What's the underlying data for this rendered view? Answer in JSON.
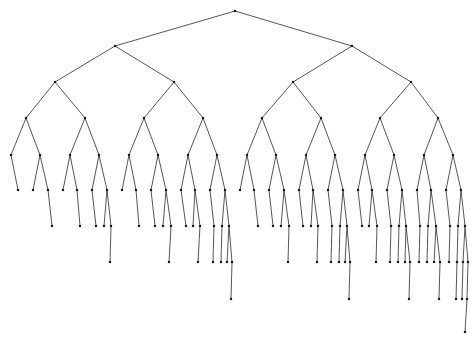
{
  "figure": {
    "type": "node-link-tree",
    "background_color": "#ffffff",
    "edge_color": "#2b2b2b",
    "node_color": "#1a1a1a",
    "edge_width": 0.8,
    "node_size": 2.2,
    "width": 475,
    "height": 345
  },
  "chart_data": {
    "type": "diagram",
    "subtype": "binary-tree",
    "orientation": "top-down",
    "root": {
      "x": 235,
      "y": 11
    },
    "level_y": [
      11,
      46,
      82,
      118,
      155,
      190,
      226,
      262,
      299,
      332
    ],
    "level_counts": [
      1,
      2,
      4,
      8,
      16,
      32,
      37,
      22,
      7,
      1
    ],
    "max_depth": 9,
    "nodes": [
      {
        "id": 0,
        "level": 0,
        "x": 235,
        "y": 11,
        "parent": null
      },
      {
        "id": 1,
        "level": 1,
        "x": 115,
        "y": 46,
        "parent": 0
      },
      {
        "id": 2,
        "level": 1,
        "x": 352,
        "y": 46,
        "parent": 0
      },
      {
        "id": 3,
        "level": 2,
        "x": 55,
        "y": 82,
        "parent": 1
      },
      {
        "id": 4,
        "level": 2,
        "x": 174,
        "y": 82,
        "parent": 1
      },
      {
        "id": 5,
        "level": 2,
        "x": 293,
        "y": 82,
        "parent": 2
      },
      {
        "id": 6,
        "level": 2,
        "x": 411,
        "y": 82,
        "parent": 2
      },
      {
        "id": 7,
        "level": 3,
        "x": 26,
        "y": 118,
        "parent": 3
      },
      {
        "id": 8,
        "level": 3,
        "x": 85,
        "y": 118,
        "parent": 3
      },
      {
        "id": 9,
        "level": 3,
        "x": 144,
        "y": 118,
        "parent": 4
      },
      {
        "id": 10,
        "level": 3,
        "x": 203,
        "y": 118,
        "parent": 4
      },
      {
        "id": 11,
        "level": 3,
        "x": 262,
        "y": 118,
        "parent": 5
      },
      {
        "id": 12,
        "level": 3,
        "x": 321,
        "y": 118,
        "parent": 5
      },
      {
        "id": 13,
        "level": 3,
        "x": 380,
        "y": 118,
        "parent": 6
      },
      {
        "id": 14,
        "level": 3,
        "x": 438,
        "y": 118,
        "parent": 6
      },
      {
        "id": 15,
        "level": 4,
        "x": 11,
        "y": 155,
        "parent": 7
      },
      {
        "id": 16,
        "level": 4,
        "x": 40,
        "y": 155,
        "parent": 7
      },
      {
        "id": 17,
        "level": 4,
        "x": 70,
        "y": 155,
        "parent": 8
      },
      {
        "id": 18,
        "level": 4,
        "x": 99,
        "y": 155,
        "parent": 8
      },
      {
        "id": 19,
        "level": 4,
        "x": 129,
        "y": 155,
        "parent": 9
      },
      {
        "id": 20,
        "level": 4,
        "x": 158,
        "y": 155,
        "parent": 9
      },
      {
        "id": 21,
        "level": 4,
        "x": 188,
        "y": 155,
        "parent": 10
      },
      {
        "id": 22,
        "level": 4,
        "x": 217,
        "y": 155,
        "parent": 10
      },
      {
        "id": 23,
        "level": 4,
        "x": 247,
        "y": 155,
        "parent": 11
      },
      {
        "id": 24,
        "level": 4,
        "x": 276,
        "y": 155,
        "parent": 11
      },
      {
        "id": 25,
        "level": 4,
        "x": 306,
        "y": 155,
        "parent": 12
      },
      {
        "id": 26,
        "level": 4,
        "x": 335,
        "y": 155,
        "parent": 12
      },
      {
        "id": 27,
        "level": 4,
        "x": 365,
        "y": 155,
        "parent": 13
      },
      {
        "id": 28,
        "level": 4,
        "x": 394,
        "y": 155,
        "parent": 13
      },
      {
        "id": 29,
        "level": 4,
        "x": 424,
        "y": 155,
        "parent": 14
      },
      {
        "id": 30,
        "level": 4,
        "x": 453,
        "y": 155,
        "parent": 14
      },
      {
        "id": 31,
        "level": 5,
        "x": 18,
        "y": 190,
        "parent": 15
      },
      {
        "id": 32,
        "level": 5,
        "x": 33,
        "y": 190,
        "parent": 16
      },
      {
        "id": 33,
        "level": 5,
        "x": 48,
        "y": 190,
        "parent": 16
      },
      {
        "id": 34,
        "level": 5,
        "x": 63,
        "y": 190,
        "parent": 17
      },
      {
        "id": 35,
        "level": 5,
        "x": 77,
        "y": 190,
        "parent": 17
      },
      {
        "id": 36,
        "level": 5,
        "x": 92,
        "y": 190,
        "parent": 18
      },
      {
        "id": 37,
        "level": 5,
        "x": 107,
        "y": 190,
        "parent": 18
      },
      {
        "id": 38,
        "level": 5,
        "x": 122,
        "y": 190,
        "parent": 19
      },
      {
        "id": 39,
        "level": 5,
        "x": 136,
        "y": 190,
        "parent": 19
      },
      {
        "id": 40,
        "level": 5,
        "x": 151,
        "y": 190,
        "parent": 20
      },
      {
        "id": 41,
        "level": 5,
        "x": 166,
        "y": 190,
        "parent": 20
      },
      {
        "id": 42,
        "level": 5,
        "x": 181,
        "y": 190,
        "parent": 21
      },
      {
        "id": 43,
        "level": 5,
        "x": 195,
        "y": 190,
        "parent": 21
      },
      {
        "id": 44,
        "level": 5,
        "x": 210,
        "y": 190,
        "parent": 22
      },
      {
        "id": 45,
        "level": 5,
        "x": 225,
        "y": 190,
        "parent": 22
      },
      {
        "id": 46,
        "level": 5,
        "x": 240,
        "y": 190,
        "parent": 23
      },
      {
        "id": 47,
        "level": 5,
        "x": 254,
        "y": 190,
        "parent": 23
      },
      {
        "id": 48,
        "level": 5,
        "x": 269,
        "y": 190,
        "parent": 24
      },
      {
        "id": 49,
        "level": 5,
        "x": 284,
        "y": 190,
        "parent": 24
      },
      {
        "id": 50,
        "level": 5,
        "x": 299,
        "y": 190,
        "parent": 25
      },
      {
        "id": 51,
        "level": 5,
        "x": 313,
        "y": 190,
        "parent": 25
      },
      {
        "id": 52,
        "level": 5,
        "x": 328,
        "y": 190,
        "parent": 26
      },
      {
        "id": 53,
        "level": 5,
        "x": 343,
        "y": 190,
        "parent": 26
      },
      {
        "id": 54,
        "level": 5,
        "x": 358,
        "y": 190,
        "parent": 27
      },
      {
        "id": 55,
        "level": 5,
        "x": 372,
        "y": 190,
        "parent": 27
      },
      {
        "id": 56,
        "level": 5,
        "x": 387,
        "y": 190,
        "parent": 28
      },
      {
        "id": 57,
        "level": 5,
        "x": 402,
        "y": 190,
        "parent": 28
      },
      {
        "id": 58,
        "level": 5,
        "x": 417,
        "y": 190,
        "parent": 29
      },
      {
        "id": 59,
        "level": 5,
        "x": 431,
        "y": 190,
        "parent": 29
      },
      {
        "id": 60,
        "level": 5,
        "x": 446,
        "y": 190,
        "parent": 30
      },
      {
        "id": 61,
        "level": 5,
        "x": 461,
        "y": 190,
        "parent": 30
      },
      {
        "id": 62,
        "level": 6,
        "x": 52,
        "y": 226,
        "parent": 33
      },
      {
        "id": 63,
        "level": 6,
        "x": 80,
        "y": 226,
        "parent": 35
      },
      {
        "id": 64,
        "level": 6,
        "x": 96,
        "y": 226,
        "parent": 36
      },
      {
        "id": 65,
        "level": 6,
        "x": 104,
        "y": 226,
        "parent": 37
      },
      {
        "id": 66,
        "level": 6,
        "x": 111,
        "y": 226,
        "parent": 37
      },
      {
        "id": 67,
        "level": 6,
        "x": 139,
        "y": 226,
        "parent": 39
      },
      {
        "id": 68,
        "level": 6,
        "x": 155,
        "y": 226,
        "parent": 40
      },
      {
        "id": 69,
        "level": 6,
        "x": 163,
        "y": 226,
        "parent": 41
      },
      {
        "id": 70,
        "level": 6,
        "x": 171,
        "y": 226,
        "parent": 41
      },
      {
        "id": 71,
        "level": 6,
        "x": 186,
        "y": 226,
        "parent": 42
      },
      {
        "id": 72,
        "level": 6,
        "x": 193,
        "y": 226,
        "parent": 43
      },
      {
        "id": 73,
        "level": 6,
        "x": 200,
        "y": 226,
        "parent": 43
      },
      {
        "id": 74,
        "level": 6,
        "x": 214,
        "y": 226,
        "parent": 44
      },
      {
        "id": 75,
        "level": 6,
        "x": 222,
        "y": 226,
        "parent": 45
      },
      {
        "id": 76,
        "level": 6,
        "x": 229,
        "y": 226,
        "parent": 45
      },
      {
        "id": 77,
        "level": 6,
        "x": 258,
        "y": 226,
        "parent": 47
      },
      {
        "id": 78,
        "level": 6,
        "x": 273,
        "y": 226,
        "parent": 48
      },
      {
        "id": 79,
        "level": 6,
        "x": 281,
        "y": 226,
        "parent": 49
      },
      {
        "id": 80,
        "level": 6,
        "x": 289,
        "y": 226,
        "parent": 49
      },
      {
        "id": 81,
        "level": 6,
        "x": 303,
        "y": 226,
        "parent": 50
      },
      {
        "id": 82,
        "level": 6,
        "x": 311,
        "y": 226,
        "parent": 51
      },
      {
        "id": 83,
        "level": 6,
        "x": 318,
        "y": 226,
        "parent": 51
      },
      {
        "id": 84,
        "level": 6,
        "x": 332,
        "y": 226,
        "parent": 52
      },
      {
        "id": 85,
        "level": 6,
        "x": 340,
        "y": 226,
        "parent": 53
      },
      {
        "id": 86,
        "level": 6,
        "x": 347,
        "y": 226,
        "parent": 53
      },
      {
        "id": 87,
        "level": 6,
        "x": 362,
        "y": 226,
        "parent": 54
      },
      {
        "id": 88,
        "level": 6,
        "x": 369,
        "y": 226,
        "parent": 55
      },
      {
        "id": 89,
        "level": 6,
        "x": 377,
        "y": 226,
        "parent": 55
      },
      {
        "id": 90,
        "level": 6,
        "x": 391,
        "y": 226,
        "parent": 56
      },
      {
        "id": 91,
        "level": 6,
        "x": 399,
        "y": 226,
        "parent": 57
      },
      {
        "id": 92,
        "level": 6,
        "x": 406,
        "y": 226,
        "parent": 57
      },
      {
        "id": 93,
        "level": 6,
        "x": 420,
        "y": 226,
        "parent": 58
      },
      {
        "id": 94,
        "level": 6,
        "x": 428,
        "y": 226,
        "parent": 59
      },
      {
        "id": 95,
        "level": 6,
        "x": 436,
        "y": 226,
        "parent": 59
      },
      {
        "id": 96,
        "level": 6,
        "x": 450,
        "y": 226,
        "parent": 60
      },
      {
        "id": 97,
        "level": 6,
        "x": 458,
        "y": 226,
        "parent": 61
      },
      {
        "id": 98,
        "level": 6,
        "x": 465,
        "y": 226,
        "parent": 61
      },
      {
        "id": 99,
        "level": 7,
        "x": 110,
        "y": 262,
        "parent": 66
      },
      {
        "id": 100,
        "level": 7,
        "x": 169,
        "y": 262,
        "parent": 70
      },
      {
        "id": 101,
        "level": 7,
        "x": 198,
        "y": 262,
        "parent": 73
      },
      {
        "id": 102,
        "level": 7,
        "x": 213,
        "y": 262,
        "parent": 74
      },
      {
        "id": 103,
        "level": 7,
        "x": 221,
        "y": 262,
        "parent": 75
      },
      {
        "id": 104,
        "level": 7,
        "x": 227,
        "y": 262,
        "parent": 76
      },
      {
        "id": 105,
        "level": 7,
        "x": 232,
        "y": 262,
        "parent": 76
      },
      {
        "id": 106,
        "level": 7,
        "x": 288,
        "y": 262,
        "parent": 80
      },
      {
        "id": 107,
        "level": 7,
        "x": 317,
        "y": 262,
        "parent": 83
      },
      {
        "id": 108,
        "level": 7,
        "x": 331,
        "y": 262,
        "parent": 84
      },
      {
        "id": 109,
        "level": 7,
        "x": 339,
        "y": 262,
        "parent": 85
      },
      {
        "id": 110,
        "level": 7,
        "x": 345,
        "y": 262,
        "parent": 86
      },
      {
        "id": 111,
        "level": 7,
        "x": 350,
        "y": 262,
        "parent": 86
      },
      {
        "id": 112,
        "level": 7,
        "x": 376,
        "y": 262,
        "parent": 89
      },
      {
        "id": 113,
        "level": 7,
        "x": 390,
        "y": 262,
        "parent": 90
      },
      {
        "id": 114,
        "level": 7,
        "x": 398,
        "y": 262,
        "parent": 91
      },
      {
        "id": 115,
        "level": 7,
        "x": 405,
        "y": 262,
        "parent": 92
      },
      {
        "id": 116,
        "level": 7,
        "x": 410,
        "y": 262,
        "parent": 92
      },
      {
        "id": 117,
        "level": 7,
        "x": 419,
        "y": 262,
        "parent": 93
      },
      {
        "id": 118,
        "level": 7,
        "x": 427,
        "y": 262,
        "parent": 94
      },
      {
        "id": 119,
        "level": 7,
        "x": 434,
        "y": 262,
        "parent": 95
      },
      {
        "id": 120,
        "level": 7,
        "x": 440,
        "y": 262,
        "parent": 95
      },
      {
        "id": 121,
        "level": 7,
        "x": 449,
        "y": 262,
        "parent": 96
      },
      {
        "id": 122,
        "level": 7,
        "x": 457,
        "y": 262,
        "parent": 97
      },
      {
        "id": 123,
        "level": 7,
        "x": 463,
        "y": 262,
        "parent": 98
      },
      {
        "id": 124,
        "level": 7,
        "x": 468,
        "y": 262,
        "parent": 98
      },
      {
        "id": 125,
        "level": 8,
        "x": 231,
        "y": 299,
        "parent": 105
      },
      {
        "id": 126,
        "level": 8,
        "x": 349,
        "y": 299,
        "parent": 111
      },
      {
        "id": 127,
        "level": 8,
        "x": 409,
        "y": 299,
        "parent": 116
      },
      {
        "id": 128,
        "level": 8,
        "x": 439,
        "y": 299,
        "parent": 120
      },
      {
        "id": 129,
        "level": 8,
        "x": 456,
        "y": 299,
        "parent": 122
      },
      {
        "id": 130,
        "level": 8,
        "x": 462,
        "y": 299,
        "parent": 123
      },
      {
        "id": 131,
        "level": 8,
        "x": 467,
        "y": 299,
        "parent": 124
      },
      {
        "id": 132,
        "level": 9,
        "x": 465,
        "y": 332,
        "parent": 131
      }
    ]
  }
}
